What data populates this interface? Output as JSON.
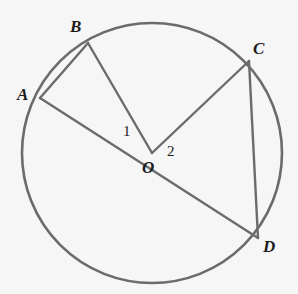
{
  "figure": {
    "background_color": "#f6f6f6",
    "stroke_color": "#6b6b6b",
    "label_color": "#1b1b1b",
    "width": 298,
    "height": 294
  },
  "circle": {
    "name": "circle-O",
    "center_x": 152,
    "center_y": 153,
    "radius": 130,
    "stroke_width": 2.6
  },
  "points": [
    {
      "id": "A",
      "label": "A",
      "x": 40,
      "y": 98,
      "label_x": 17,
      "label_y": 86
    },
    {
      "id": "B",
      "label": "B",
      "x": 88,
      "y": 43,
      "label_x": 70,
      "label_y": 18
    },
    {
      "id": "C",
      "label": "C",
      "x": 249,
      "y": 61,
      "label_x": 253,
      "label_y": 40
    },
    {
      "id": "D",
      "label": "D",
      "x": 258,
      "y": 238,
      "label_x": 263,
      "label_y": 238
    },
    {
      "id": "O",
      "label": "O",
      "x": 152,
      "y": 153,
      "label_x": 142,
      "label_y": 159
    }
  ],
  "segments": [
    {
      "name": "chord-AB",
      "from": "A",
      "to": "B",
      "x1": 40,
      "y1": 98,
      "x2": 88,
      "y2": 43
    },
    {
      "name": "radius-BO",
      "from": "B",
      "to": "O",
      "x1": 88,
      "y1": 43,
      "x2": 152,
      "y2": 153
    },
    {
      "name": "diameter-AD",
      "from": "A",
      "to": "D",
      "x1": 40,
      "y1": 98,
      "x2": 258,
      "y2": 238
    },
    {
      "name": "radius-OC",
      "from": "O",
      "to": "C",
      "x1": 152,
      "y1": 153,
      "x2": 249,
      "y2": 61
    },
    {
      "name": "chord-CD",
      "from": "C",
      "to": "D",
      "x1": 249,
      "y1": 61,
      "x2": 258,
      "y2": 238
    }
  ],
  "angle_labels": [
    {
      "id": "angle-1",
      "label": "1",
      "x": 123,
      "y": 124,
      "describes": "angle AOB"
    },
    {
      "id": "angle-2",
      "label": "2",
      "x": 167,
      "y": 144,
      "describes": "angle COD"
    }
  ]
}
